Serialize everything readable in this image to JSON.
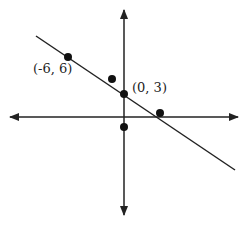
{
  "diagram": {
    "type": "coordinate-plane",
    "axes": {
      "color": "#222222",
      "x_axis": {
        "y": 117,
        "from": 10,
        "to": 238
      },
      "y_axis": {
        "x": 124,
        "from": 10,
        "to": 215
      }
    },
    "line": {
      "x1": 36,
      "y1": 36,
      "x2": 235,
      "y2": 170,
      "color": "#222222"
    },
    "points": [
      {
        "id": "p1",
        "label": "(-6, 6)",
        "cx": 68,
        "cy": 57,
        "lx": 33,
        "ly": 73
      },
      {
        "id": "p2",
        "label": "(0, 3)",
        "cx": 124,
        "cy": 94,
        "lx": 132,
        "ly": 92
      },
      {
        "id": "p3",
        "label": "",
        "cx": 112,
        "cy": 79
      },
      {
        "id": "p4",
        "label": "",
        "cx": 160,
        "cy": 113
      },
      {
        "id": "p5",
        "label": "",
        "cx": 124,
        "cy": 127
      }
    ]
  },
  "labels": {
    "point_a": "(-6, 6)",
    "point_b": "(0, 3)"
  }
}
